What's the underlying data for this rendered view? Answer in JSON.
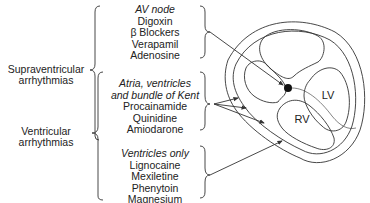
{
  "categories": {
    "supraventricular": {
      "line1": "Supraventricular",
      "line2": "arrhythmias"
    },
    "ventricular": {
      "line1": "Ventricular",
      "line2": "arrhythmias"
    }
  },
  "groups": [
    {
      "heading": "AV node",
      "drugs": [
        "Digoxin",
        "β Blockers",
        "Verapamil",
        "Adenosine"
      ]
    },
    {
      "heading_line1": "Atria, ventricles",
      "heading_line2": "and bundle of Kent",
      "drugs": [
        "Procainamide",
        "Quinidine",
        "Amiodarone"
      ]
    },
    {
      "heading": "Ventricles only",
      "drugs": [
        "Lignocaine",
        "Mexiletine",
        "Phenytoin",
        "Magnesium"
      ]
    }
  ],
  "heart": {
    "lv_label": "LV",
    "rv_label": "RV"
  },
  "colors": {
    "line": "#333333",
    "text": "#222222",
    "background": "#ffffff"
  }
}
